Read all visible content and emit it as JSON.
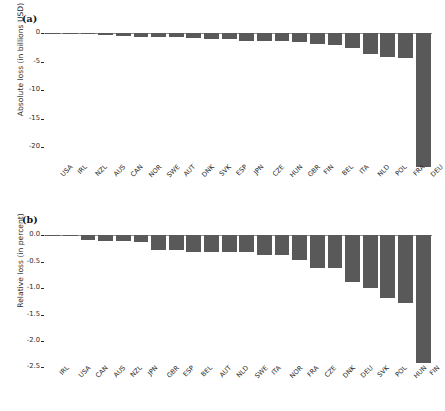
{
  "figure": {
    "background_color": "#ffffff",
    "bar_color": "#595959",
    "axis_color": "#2b2b2b"
  },
  "panels": [
    {
      "id": "a",
      "label": "(a)",
      "ylabel": "Absolute loss (in billions USD)",
      "ytick_labels": [
        "0",
        "-5",
        "-10",
        "-15",
        "-20"
      ]
    },
    {
      "id": "b",
      "label": "(b)",
      "ylabel": "Relative loss (in percent)",
      "ytick_labels": [
        "0.0",
        "-0.5",
        "-1.0",
        "-1.5",
        "-2.0",
        "-2.5"
      ]
    }
  ],
  "chart_data": [
    {
      "type": "bar",
      "panel": "a",
      "title": "",
      "xlabel": "",
      "ylabel": "Absolute loss (in billions USD)",
      "ylim": [
        -23.8,
        0.6
      ],
      "yticks": [
        0,
        -5,
        -10,
        -15,
        -20
      ],
      "grid": false,
      "legend": null,
      "orientation": "vertical",
      "categories": [
        "USA",
        "IRL",
        "NZL",
        "AUS",
        "CAN",
        "NOR",
        "SWE",
        "AUT",
        "DNK",
        "SVK",
        "ESP",
        "JPN",
        "CZE",
        "HUN",
        "GBR",
        "FIN",
        "BEL",
        "ITA",
        "NLD",
        "POL",
        "FRA",
        "DEU"
      ],
      "values": [
        -0.05,
        -0.02,
        -0.02,
        -0.3,
        -0.5,
        -0.6,
        -0.65,
        -0.7,
        -0.8,
        -1.0,
        -1.05,
        -1.3,
        -1.4,
        -1.4,
        -1.5,
        -1.9,
        -2.0,
        -2.6,
        -3.6,
        -4.1,
        -4.3,
        -23.4
      ]
    },
    {
      "type": "bar",
      "panel": "b",
      "title": "",
      "xlabel": "",
      "ylabel": "Relative loss (in percent)",
      "ylim": [
        -2.55,
        0.08
      ],
      "yticks": [
        0.0,
        -0.5,
        -1.0,
        -1.5,
        -2.0,
        -2.5
      ],
      "grid": false,
      "legend": null,
      "orientation": "vertical",
      "categories": [
        "IRL",
        "USA",
        "CAN",
        "AUS",
        "NZL",
        "JPN",
        "GBR",
        "ESP",
        "BEL",
        "AUT",
        "NLD",
        "SWE",
        "ITA",
        "NOR",
        "FRA",
        "CZE",
        "DNK",
        "DEU",
        "SVK",
        "POL",
        "HUN",
        "FIN"
      ],
      "values": [
        -0.01,
        -0.01,
        -0.09,
        -0.11,
        -0.11,
        -0.13,
        -0.28,
        -0.28,
        -0.32,
        -0.31,
        -0.31,
        -0.31,
        -0.37,
        -0.38,
        -0.46,
        -0.62,
        -0.62,
        -0.88,
        -0.99,
        -1.18,
        -1.29,
        -2.41
      ]
    }
  ]
}
